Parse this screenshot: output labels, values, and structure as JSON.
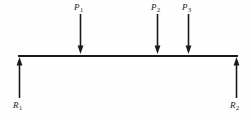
{
  "figure": {
    "background_color": "#fefefe",
    "line_color": "#1a1a1a",
    "beam": {
      "name": "beam",
      "x_start": 18,
      "x_end": 238,
      "y": 55,
      "thickness": 2
    },
    "loads": [
      {
        "id": "P1",
        "label": "P",
        "subscript": "1",
        "direction": "down",
        "x": 80,
        "label_x": 74,
        "label_y": 3,
        "arrow_top": 14,
        "arrow_bottom": 54
      },
      {
        "id": "P2",
        "label": "P",
        "subscript": "2",
        "direction": "down",
        "x": 157,
        "label_x": 151,
        "label_y": 3,
        "arrow_top": 14,
        "arrow_bottom": 54
      },
      {
        "id": "P3",
        "label": "P",
        "subscript": "3",
        "direction": "down",
        "x": 188,
        "label_x": 182,
        "label_y": 3,
        "arrow_top": 14,
        "arrow_bottom": 54
      }
    ],
    "reactions": [
      {
        "id": "R1",
        "label": "R",
        "subscript": "1",
        "direction": "up",
        "x": 19,
        "label_x": 13,
        "label_y": 101,
        "arrow_top": 57,
        "arrow_bottom": 98
      },
      {
        "id": "R2",
        "label": "R",
        "subscript": "2",
        "direction": "up",
        "x": 236,
        "label_x": 230,
        "label_y": 101,
        "arrow_top": 57,
        "arrow_bottom": 98
      }
    ]
  }
}
